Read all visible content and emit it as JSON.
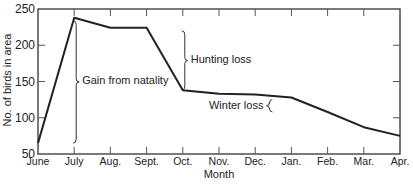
{
  "chart_data": {
    "type": "line",
    "title": "",
    "xlabel": "Month",
    "ylabel": "No. of birds in area",
    "ylim": [
      50,
      250
    ],
    "yticks": [
      50,
      100,
      150,
      200,
      250
    ],
    "categories": [
      "June",
      "July",
      "Aug.",
      "Sept.",
      "Oct.",
      "Nov.",
      "Dec.",
      "Jan.",
      "Feb.",
      "Mar.",
      "Apr."
    ],
    "series": [
      {
        "name": "Birds in area",
        "values": [
          65,
          238,
          224,
          224,
          138,
          133,
          132,
          128,
          108,
          87,
          75
        ]
      }
    ],
    "grid": false,
    "legend": null,
    "annotations": [
      {
        "text": "Gain from natality",
        "bracket_month": "July",
        "from": 65,
        "to": 238
      },
      {
        "text": "Hunting loss",
        "bracket_month": "Oct.",
        "from": 138,
        "to": 224
      },
      {
        "text": "Winter loss",
        "bracket_month": "Jan.",
        "from": 108,
        "to": 128
      }
    ]
  }
}
